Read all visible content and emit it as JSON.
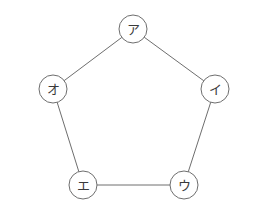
{
  "diagram": {
    "type": "graph",
    "shape": "pentagon",
    "nodes": [
      {
        "id": "a",
        "label": "ア",
        "x": 133,
        "y": 29
      },
      {
        "id": "i",
        "label": "イ",
        "x": 215,
        "y": 89
      },
      {
        "id": "u",
        "label": "ウ",
        "x": 184,
        "y": 185
      },
      {
        "id": "e",
        "label": "エ",
        "x": 83,
        "y": 185
      },
      {
        "id": "o",
        "label": "オ",
        "x": 53,
        "y": 89
      }
    ],
    "edges": [
      {
        "from": "a",
        "to": "i"
      },
      {
        "from": "i",
        "to": "u"
      },
      {
        "from": "u",
        "to": "e"
      },
      {
        "from": "e",
        "to": "o"
      },
      {
        "from": "o",
        "to": "a"
      }
    ],
    "node_radius": 14,
    "colors": {
      "stroke": "#6e6e6e",
      "text": "#3a3a3a",
      "background": "#ffffff"
    }
  }
}
